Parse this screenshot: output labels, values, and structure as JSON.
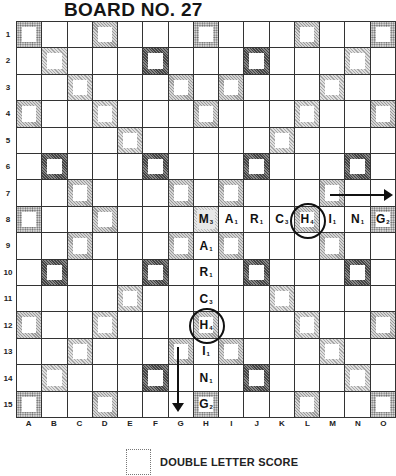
{
  "title": "BOARD NO. 27",
  "rows": [
    "1",
    "2",
    "3",
    "4",
    "5",
    "6",
    "7",
    "8",
    "9",
    "10",
    "11",
    "12",
    "13",
    "14",
    "15"
  ],
  "columns": [
    "A",
    "B",
    "C",
    "D",
    "E",
    "F",
    "G",
    "H",
    "I",
    "J",
    "K",
    "L",
    "M",
    "N",
    "O"
  ],
  "premium_squares": {
    "tw": [
      "A1",
      "H1",
      "O1",
      "A8",
      "O8",
      "A15",
      "H15",
      "O15"
    ],
    "dw": [
      "B2",
      "N2",
      "C3",
      "M3",
      "D4",
      "L4",
      "E5",
      "K5",
      "E11",
      "K11",
      "D12",
      "L12",
      "C13",
      "M13",
      "B14",
      "N14"
    ],
    "tl": [
      "F2",
      "J2",
      "B6",
      "F6",
      "J6",
      "N6",
      "B10",
      "F10",
      "J10",
      "N10",
      "F14",
      "J14"
    ],
    "dl": [
      "D1",
      "L1",
      "G3",
      "I3",
      "A4",
      "H4",
      "O4",
      "C7",
      "G7",
      "I7",
      "M7",
      "D8",
      "L8",
      "C9",
      "G9",
      "I9",
      "M9",
      "A12",
      "H12",
      "O12",
      "G13",
      "I13",
      "D15",
      "L15"
    ],
    "star": [
      "H8"
    ]
  },
  "words": [
    {
      "word": "MARCHING",
      "direction": "across",
      "start": "H8",
      "tiles": [
        {
          "cell": "H8",
          "letter": "M",
          "value": "3"
        },
        {
          "cell": "I8",
          "letter": "A",
          "value": "1"
        },
        {
          "cell": "J8",
          "letter": "R",
          "value": "1"
        },
        {
          "cell": "K8",
          "letter": "C",
          "value": "3"
        },
        {
          "cell": "L8",
          "letter": "H",
          "value": "4"
        },
        {
          "cell": "M8",
          "letter": "I",
          "value": "1"
        },
        {
          "cell": "N8",
          "letter": "N",
          "value": "1"
        },
        {
          "cell": "O8",
          "letter": "G",
          "value": "2"
        }
      ]
    },
    {
      "word": "MARCHING",
      "direction": "down",
      "start": "H8",
      "tiles": [
        {
          "cell": "H9",
          "letter": "A",
          "value": "1"
        },
        {
          "cell": "H10",
          "letter": "R",
          "value": "1"
        },
        {
          "cell": "H11",
          "letter": "C",
          "value": "3"
        },
        {
          "cell": "H12",
          "letter": "H",
          "value": "4"
        },
        {
          "cell": "H13",
          "letter": "I",
          "value": "1"
        },
        {
          "cell": "H14",
          "letter": "N",
          "value": "1"
        },
        {
          "cell": "H15",
          "letter": "G",
          "value": "2"
        }
      ]
    }
  ],
  "circled_cells": [
    "L8",
    "H12"
  ],
  "arrows": [
    {
      "direction": "right",
      "row": "7",
      "from": "M",
      "to": "O"
    },
    {
      "direction": "down",
      "column": "G",
      "from": "13",
      "to": "15"
    }
  ],
  "legend": {
    "label": "DOUBLE LETTER SCORE"
  }
}
